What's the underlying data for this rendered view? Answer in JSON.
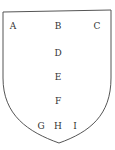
{
  "diagram": {
    "shape": "shield",
    "stroke_color": "#555555",
    "points": [
      {
        "label": "A",
        "x": 13,
        "y": 26
      },
      {
        "label": "B",
        "x": 58,
        "y": 26
      },
      {
        "label": "C",
        "x": 97,
        "y": 26
      },
      {
        "label": "D",
        "x": 58,
        "y": 53
      },
      {
        "label": "E",
        "x": 58,
        "y": 77
      },
      {
        "label": "F",
        "x": 58,
        "y": 101
      },
      {
        "label": "G",
        "x": 41,
        "y": 126
      },
      {
        "label": "H",
        "x": 58,
        "y": 126
      },
      {
        "label": "I",
        "x": 75,
        "y": 126
      }
    ]
  }
}
